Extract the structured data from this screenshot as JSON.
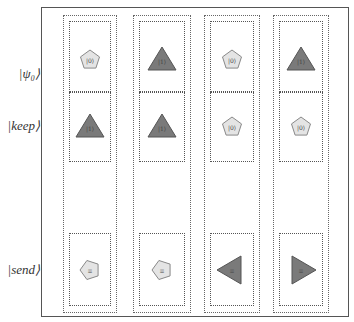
{
  "row_labels": {
    "psi0": "|ψ₀⟩",
    "keep": "|keep⟩",
    "send": "|send⟩"
  },
  "colors": {
    "pentagon_fill": "#e4e4e4",
    "triangle_fill": "#7a7a7a",
    "border": "#555555"
  },
  "columns": [
    {
      "psi0": {
        "shape": "pentagon",
        "symbol": "|0⟩"
      },
      "keep": {
        "shape": "triangle-up",
        "symbol": "|1⟩"
      },
      "send": {
        "shape": "pentagon-rotated",
        "symbol": "≡"
      }
    },
    {
      "psi0": {
        "shape": "triangle-up",
        "symbol": "|1⟩"
      },
      "keep": {
        "shape": "triangle-up",
        "symbol": "|1⟩"
      },
      "send": {
        "shape": "pentagon-rotated",
        "symbol": "≡"
      }
    },
    {
      "psi0": {
        "shape": "pentagon",
        "symbol": "|0⟩"
      },
      "keep": {
        "shape": "pentagon",
        "symbol": "|0⟩"
      },
      "send": {
        "shape": "triangle-left",
        "symbol": "≡"
      }
    },
    {
      "psi0": {
        "shape": "triangle-up",
        "symbol": "|1⟩"
      },
      "keep": {
        "shape": "pentagon",
        "symbol": "|0⟩"
      },
      "send": {
        "shape": "triangle-right",
        "symbol": "≡"
      }
    }
  ]
}
